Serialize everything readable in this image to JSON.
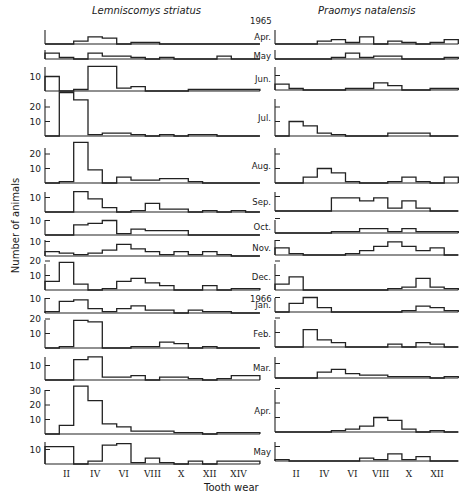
{
  "figure": {
    "left_title": "Lemniscomys striatus",
    "right_title": "Praomys natalensis",
    "y_axis_label": "Number of animals",
    "x_axis_label": "Tooth wear",
    "year_labels": [
      {
        "text": "1965",
        "before_month_index": 0
      },
      {
        "text": "1966",
        "before_month_index": 9
      }
    ]
  },
  "chart_data": [
    {
      "type": "bar",
      "subtype": "stacked-histogram-panels",
      "title": "Lemniscomys striatus",
      "xlabel": "Tooth wear",
      "ylabel": "Number of animals",
      "categories": [
        "I",
        "II",
        "III",
        "IV",
        "V",
        "VI",
        "VII",
        "VIII",
        "IX",
        "X",
        "XI",
        "XII",
        "XIII",
        "XIV",
        "XV"
      ],
      "x_tick_labels": [
        "II",
        "IV",
        "VI",
        "VIII",
        "X",
        "XII",
        "XIV"
      ],
      "grid": false,
      "panels": [
        {
          "month": "Apr.",
          "yticks": [],
          "values": [
            0,
            0,
            2,
            5,
            4,
            0,
            1,
            1,
            0,
            0,
            0,
            0,
            0,
            0,
            0
          ]
        },
        {
          "month": "May",
          "yticks": [],
          "values": [
            4,
            1,
            0,
            4,
            2,
            2,
            1,
            0,
            1,
            0,
            0,
            0,
            2,
            0,
            0
          ]
        },
        {
          "month": "Jun.",
          "yticks": [
            10
          ],
          "values": [
            10,
            0,
            1,
            17,
            17,
            2,
            3,
            0,
            0,
            0,
            1,
            1,
            1,
            1,
            1
          ]
        },
        {
          "month": "Jul.",
          "yticks": [
            10,
            20
          ],
          "values": [
            0,
            30,
            25,
            1,
            2,
            2,
            1,
            0,
            1,
            0,
            1,
            1,
            0,
            0,
            0
          ]
        },
        {
          "month": "Aug.",
          "yticks": [
            10,
            20
          ],
          "values": [
            0,
            1,
            28,
            9,
            0,
            4,
            2,
            2,
            3,
            3,
            1,
            0,
            0,
            0,
            0
          ]
        },
        {
          "month": "Sep.",
          "yticks": [
            10
          ],
          "values": [
            0,
            0,
            14,
            9,
            3,
            0,
            1,
            6,
            2,
            2,
            0,
            1,
            0,
            1,
            0
          ]
        },
        {
          "month": "Oct.",
          "yticks": [
            10
          ],
          "values": [
            0,
            0,
            7,
            8,
            10,
            1,
            4,
            3,
            3,
            3,
            0,
            0,
            0,
            0,
            0
          ]
        },
        {
          "month": "Nov.",
          "yticks": [
            10
          ],
          "values": [
            3,
            2,
            1,
            2,
            4,
            8,
            5,
            3,
            1,
            3,
            1,
            3,
            1,
            0,
            0
          ]
        },
        {
          "month": "Dec.",
          "yticks": [
            10,
            20
          ],
          "values": [
            6,
            19,
            4,
            0,
            1,
            6,
            8,
            5,
            3,
            0,
            0,
            3,
            0,
            1,
            1
          ]
        },
        {
          "month": "Jan.",
          "yticks": [
            10
          ],
          "values": [
            1,
            8,
            9,
            3,
            1,
            3,
            5,
            2,
            2,
            0,
            2,
            1,
            1,
            0,
            0
          ]
        },
        {
          "month": "Feb.",
          "yticks": [
            10,
            20
          ],
          "values": [
            0,
            1,
            19,
            18,
            0,
            0,
            1,
            1,
            4,
            3,
            0,
            1,
            0,
            0,
            0
          ]
        },
        {
          "month": "Mar.",
          "yticks": [
            10
          ],
          "values": [
            0,
            0,
            14,
            16,
            2,
            2,
            3,
            0,
            2,
            2,
            1,
            0,
            1,
            3,
            3
          ]
        },
        {
          "month": "Apr.",
          "yticks": [
            10,
            20,
            30
          ],
          "values": [
            0,
            6,
            33,
            23,
            7,
            5,
            2,
            2,
            2,
            1,
            1,
            0,
            1,
            1,
            1
          ]
        },
        {
          "month": "May",
          "yticks": [
            10
          ],
          "values": [
            12,
            12,
            0,
            2,
            13,
            14,
            1,
            4,
            1,
            0,
            2,
            0,
            2,
            2,
            2
          ]
        }
      ]
    },
    {
      "type": "bar",
      "subtype": "stacked-histogram-panels",
      "title": "Praomys natalensis",
      "xlabel": "Tooth wear",
      "ylabel": "Number of animals",
      "categories": [
        "I",
        "II",
        "III",
        "IV",
        "V",
        "VI",
        "VII",
        "VIII",
        "IX",
        "X",
        "XI",
        "XII",
        "XIII"
      ],
      "x_tick_labels": [
        "II",
        "IV",
        "VI",
        "VIII",
        "X",
        "XII"
      ],
      "grid": false,
      "panels": [
        {
          "month": "Apr.",
          "yticks": [],
          "values": [
            0,
            0,
            0,
            2,
            3,
            1,
            5,
            0,
            2,
            1,
            0,
            1,
            3
          ]
        },
        {
          "month": "May",
          "yticks": [],
          "values": [
            0,
            0,
            0,
            0,
            1,
            4,
            1,
            2,
            2,
            0,
            0,
            0,
            1
          ]
        },
        {
          "month": "Jun.",
          "yticks": [
            10
          ],
          "values": [
            4,
            1,
            0,
            0,
            0,
            1,
            1,
            5,
            3,
            0,
            0,
            1,
            1
          ]
        },
        {
          "month": "Jul.",
          "yticks": [
            10,
            20
          ],
          "values": [
            0,
            10,
            7,
            2,
            1,
            0,
            0,
            0,
            2,
            2,
            2,
            0,
            0
          ]
        },
        {
          "month": "Aug.",
          "yticks": [
            10,
            20
          ],
          "values": [
            0,
            0,
            4,
            10,
            7,
            1,
            0,
            0,
            1,
            4,
            1,
            0,
            4
          ]
        },
        {
          "month": "Sep.",
          "yticks": [
            10
          ],
          "values": [
            0,
            0,
            0,
            0,
            9,
            9,
            7,
            9,
            2,
            7,
            2,
            0,
            0
          ]
        },
        {
          "month": "Oct.",
          "yticks": [
            10
          ],
          "values": [
            0,
            0,
            0,
            0,
            1,
            1,
            3,
            3,
            1,
            3,
            1,
            1,
            1
          ]
        },
        {
          "month": "Nov.",
          "yticks": [
            10
          ],
          "values": [
            5,
            1,
            0,
            0,
            0,
            1,
            3,
            6,
            9,
            6,
            3,
            5,
            0
          ]
        },
        {
          "month": "Dec.",
          "yticks": [
            10,
            20
          ],
          "values": [
            4,
            9,
            0,
            0,
            0,
            0,
            0,
            0,
            1,
            2,
            8,
            2,
            1
          ]
        },
        {
          "month": "Jan.",
          "yticks": [
            10
          ],
          "values": [
            0,
            6,
            10,
            3,
            0,
            0,
            0,
            0,
            0,
            1,
            4,
            3,
            1
          ]
        },
        {
          "month": "Feb.",
          "yticks": [
            10,
            20
          ],
          "values": [
            0,
            0,
            12,
            5,
            3,
            0,
            0,
            0,
            2,
            0,
            3,
            2,
            0
          ]
        },
        {
          "month": "Mar.",
          "yticks": [
            10
          ],
          "values": [
            0,
            0,
            0,
            4,
            6,
            3,
            2,
            2,
            1,
            1,
            1,
            0,
            1
          ]
        },
        {
          "month": "Apr.",
          "yticks": [
            10,
            20,
            30
          ],
          "values": [
            0,
            0,
            0,
            0,
            1,
            2,
            4,
            10,
            8,
            2,
            0,
            1,
            0
          ]
        },
        {
          "month": "May",
          "yticks": [
            10
          ],
          "values": [
            1,
            0,
            0,
            0,
            0,
            0,
            2,
            1,
            5,
            1,
            3,
            0,
            0
          ]
        }
      ]
    }
  ]
}
